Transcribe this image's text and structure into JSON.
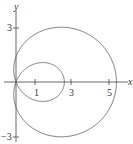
{
  "chart_data": {
    "type": "line",
    "title": "",
    "xlabel": "x",
    "ylabel": "y",
    "equation": "r = 1.4 + 4 cos θ (limaçon with inner loop)",
    "x_ticks": [
      "1",
      "3",
      "5"
    ],
    "y_ticks": [
      "3",
      "-3"
    ],
    "xlim": [
      -0.9,
      6.2
    ],
    "ylim": [
      -3.4,
      4.4
    ],
    "grid": false,
    "series": [
      {
        "name": "limaçon",
        "a": 1.4,
        "b": 4,
        "outer_max_x": 5.4,
        "inner_max_x": 2.6,
        "y_extent": [
          -3.05,
          3.05
        ]
      }
    ]
  },
  "labels": {
    "x": "x",
    "y": "y",
    "t1": "1",
    "t3": "3",
    "t5": "5",
    "y3": "3",
    "ym3": "−3"
  }
}
